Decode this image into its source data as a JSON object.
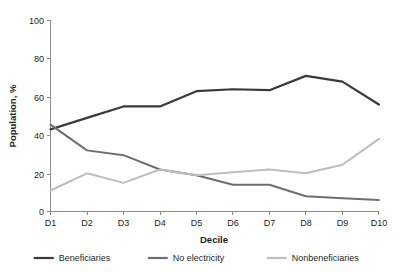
{
  "chart_data": {
    "type": "line",
    "title": "",
    "xlabel": "Decile",
    "ylabel": "Population, %",
    "categories": [
      "D1",
      "D2",
      "D3",
      "D4",
      "D5",
      "D6",
      "D7",
      "D8",
      "D9",
      "D10"
    ],
    "xticklabels": [
      "D1",
      "D2",
      "D3",
      "D4",
      "D5",
      "D6",
      "D7",
      "D8",
      "D9",
      "D10"
    ],
    "yticklabels": [
      "0",
      "20",
      "40",
      "60",
      "80",
      "100"
    ],
    "yticks": [
      0,
      20,
      40,
      60,
      80,
      100
    ],
    "ylim": [
      0,
      100
    ],
    "grid": false,
    "legend_position": "bottom",
    "series": [
      {
        "name": "Beneficiaries",
        "color": "#3a3a3a",
        "width": 2.2,
        "values": [
          43,
          49,
          55,
          55,
          63,
          64,
          63.5,
          71,
          68,
          56
        ]
      },
      {
        "name": "No electricity",
        "color": "#6e6e6e",
        "width": 2.0,
        "values": [
          45.5,
          32,
          29.5,
          22,
          19,
          14,
          14,
          8,
          7,
          6
        ]
      },
      {
        "name": "Nonbeneficiaries",
        "color": "#bdbdbd",
        "width": 2.0,
        "values": [
          11,
          20,
          15,
          22,
          19,
          20.5,
          22,
          20,
          24.5,
          38
        ]
      }
    ]
  },
  "axes": {
    "y_label": "Population, %",
    "x_label": "Decile"
  },
  "legend": {
    "items": [
      {
        "label": "Beneficiaries",
        "color": "#3a3a3a"
      },
      {
        "label": "No electricity",
        "color": "#6e6e6e"
      },
      {
        "label": "Nonbeneficiaries",
        "color": "#bdbdbd"
      }
    ]
  },
  "yticks": {
    "t0": "0",
    "t20": "20",
    "t40": "40",
    "t60": "60",
    "t80": "80",
    "t100": "100"
  },
  "xticks": {
    "d1": "D1",
    "d2": "D2",
    "d3": "D3",
    "d4": "D4",
    "d5": "D5",
    "d6": "D6",
    "d7": "D7",
    "d8": "D8",
    "d9": "D9",
    "d10": "D10"
  }
}
